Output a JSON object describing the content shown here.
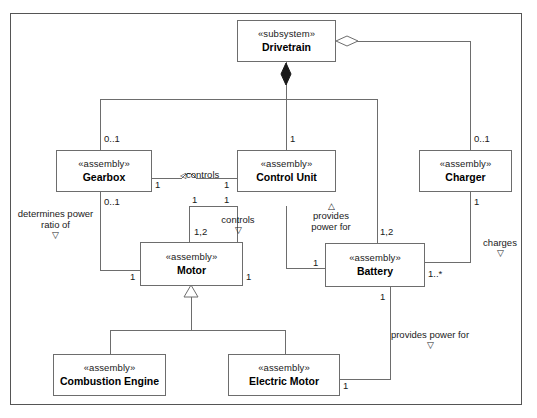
{
  "diagram": {
    "type": "uml-class-diagram",
    "frame": {
      "border_color": "#555555"
    },
    "nodes": [
      {
        "id": "drivetrain",
        "stereotype": "«subsystem»",
        "name": "Drivetrain"
      },
      {
        "id": "gearbox",
        "stereotype": "«assembly»",
        "name": "Gearbox"
      },
      {
        "id": "control_unit",
        "stereotype": "«assembly»",
        "name": "Control Unit"
      },
      {
        "id": "charger",
        "stereotype": "«assembly»",
        "name": "Charger"
      },
      {
        "id": "motor",
        "stereotype": "«assembly»",
        "name": "Motor"
      },
      {
        "id": "battery",
        "stereotype": "«assembly»",
        "name": "Battery"
      },
      {
        "id": "combustion_engine",
        "stereotype": "«assembly»",
        "name": "Combustion Engine"
      },
      {
        "id": "electric_motor",
        "stereotype": "«assembly»",
        "name": "Electric Motor"
      }
    ],
    "multiplicities": {
      "gearbox_top": "0..1",
      "gearbox_right": "1",
      "gearbox_bottom": "0..1",
      "control_unit_top": "1",
      "control_unit_left": "1",
      "control_unit_bottom_left": "1",
      "control_unit_bottom_right": "1",
      "charger_top": "0..1",
      "charger_bottom": "1",
      "motor_top": "1,2",
      "motor_left": "1",
      "motor_right": "1",
      "battery_top": "1,2",
      "battery_left": "1",
      "battery_right": "1..*",
      "battery_bottom": "1",
      "electric_motor_right": "1"
    },
    "edge_labels": {
      "controls_gearbox": "controls",
      "determines_power_ratio": "determines power\nratio of",
      "controls_motor": "controls",
      "provides_power_for_battery": "provides\npower for",
      "charges": "charges",
      "provides_power_for_electric": "provides power for"
    },
    "markers": {
      "triangle_down": "▽",
      "triangle_up": "△",
      "triangle_left": "◁"
    }
  }
}
